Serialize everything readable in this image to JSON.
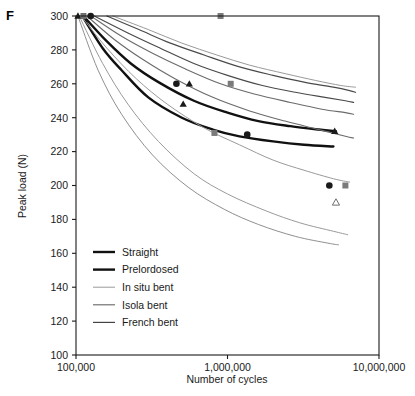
{
  "panel": {
    "label": "F"
  },
  "chart_data": {
    "type": "line",
    "title": "",
    "xlabel": "Number of cycles",
    "ylabel": "Peak load (N)",
    "xscale": "log",
    "xlim": [
      100000,
      10000000
    ],
    "ylim": [
      100,
      300
    ],
    "xticks": [
      100000,
      1000000,
      10000000
    ],
    "xtick_labels": [
      "100,000",
      "1,000,000",
      "10,000,000"
    ],
    "yticks": [
      100,
      120,
      140,
      160,
      180,
      200,
      220,
      240,
      260,
      280,
      300
    ],
    "ytick_labels": [
      "100",
      "120",
      "140",
      "160",
      "180",
      "200",
      "220",
      "240",
      "260",
      "280",
      "300"
    ],
    "grid": false,
    "legend_position": "lower-left",
    "legend": [
      {
        "name": "Straight",
        "color": "#111111",
        "width": 2.4
      },
      {
        "name": "Prelordosed",
        "color": "#111111",
        "width": 2.4
      },
      {
        "name": "In situ bent",
        "color": "#9a9a9a",
        "width": 1.0
      },
      {
        "name": "Isola bent",
        "color": "#666666",
        "width": 1.1
      },
      {
        "name": "French bent",
        "color": "#444444",
        "width": 1.2
      }
    ],
    "series": [
      {
        "name": "Straight",
        "color": "#111111",
        "width": 2.4,
        "points": [
          [
            110000,
            300
          ],
          [
            150000,
            281
          ],
          [
            200000,
            268
          ],
          [
            300000,
            252
          ],
          [
            500000,
            240
          ],
          [
            800000,
            233
          ],
          [
            1200000,
            229
          ],
          [
            2000000,
            226
          ],
          [
            3200000,
            224
          ],
          [
            5000000,
            223
          ]
        ]
      },
      {
        "name": "Prelordosed",
        "color": "#111111",
        "width": 2.4,
        "points": [
          [
            112000,
            300
          ],
          [
            160000,
            285
          ],
          [
            230000,
            272
          ],
          [
            350000,
            261
          ],
          [
            600000,
            250
          ],
          [
            1000000,
            243
          ],
          [
            1600000,
            238
          ],
          [
            2600000,
            235
          ],
          [
            4000000,
            233
          ],
          [
            5200000,
            232
          ]
        ]
      },
      {
        "name": "In situ bent A",
        "color": "#9a9a9a",
        "width": 1.0,
        "points": [
          [
            105000,
            300
          ],
          [
            150000,
            272
          ],
          [
            220000,
            248
          ],
          [
            350000,
            226
          ],
          [
            600000,
            207
          ],
          [
            1000000,
            195
          ],
          [
            1800000,
            185
          ],
          [
            3000000,
            178
          ],
          [
            5000000,
            173
          ],
          [
            6200000,
            171
          ]
        ]
      },
      {
        "name": "In situ bent B",
        "color": "#9a9a9a",
        "width": 1.0,
        "points": [
          [
            108000,
            300
          ],
          [
            160000,
            281
          ],
          [
            250000,
            263
          ],
          [
            400000,
            248
          ],
          [
            700000,
            234
          ],
          [
            1200000,
            224
          ],
          [
            2000000,
            215
          ],
          [
            3200000,
            209
          ],
          [
            5000000,
            204
          ],
          [
            6400000,
            202
          ]
        ]
      },
      {
        "name": "Isola bent A",
        "color": "#6b6b6b",
        "width": 1.1,
        "points": [
          [
            118000,
            300
          ],
          [
            180000,
            286
          ],
          [
            280000,
            274
          ],
          [
            450000,
            263
          ],
          [
            800000,
            252
          ],
          [
            1400000,
            244
          ],
          [
            2400000,
            238
          ],
          [
            4000000,
            233
          ],
          [
            6000000,
            229
          ],
          [
            6800000,
            228
          ]
        ]
      },
      {
        "name": "Isola bent B",
        "color": "#6b6b6b",
        "width": 1.1,
        "points": [
          [
            125000,
            300
          ],
          [
            200000,
            288
          ],
          [
            320000,
            278
          ],
          [
            520000,
            269
          ],
          [
            900000,
            260
          ],
          [
            1500000,
            254
          ],
          [
            2600000,
            249
          ],
          [
            4200000,
            245
          ],
          [
            6000000,
            243
          ],
          [
            6800000,
            242
          ]
        ]
      },
      {
        "name": "French bent A",
        "color": "#4a4a4a",
        "width": 1.2,
        "points": [
          [
            132000,
            300
          ],
          [
            220000,
            290
          ],
          [
            360000,
            281
          ],
          [
            600000,
            272
          ],
          [
            1000000,
            265
          ],
          [
            1700000,
            259
          ],
          [
            2800000,
            255
          ],
          [
            4400000,
            252
          ],
          [
            6000000,
            250
          ],
          [
            6800000,
            249
          ]
        ]
      },
      {
        "name": "French bent B",
        "color": "#4a4a4a",
        "width": 1.2,
        "points": [
          [
            160000,
            300
          ],
          [
            260000,
            292
          ],
          [
            420000,
            284
          ],
          [
            700000,
            277
          ],
          [
            1200000,
            270
          ],
          [
            2000000,
            265
          ],
          [
            3200000,
            261
          ],
          [
            5000000,
            258
          ],
          [
            6400000,
            256
          ],
          [
            7000000,
            255
          ]
        ]
      },
      {
        "name": "Lower gray A",
        "color": "#8f8f8f",
        "width": 1.0,
        "points": [
          [
            103000,
            300
          ],
          [
            140000,
            268
          ],
          [
            200000,
            242
          ],
          [
            320000,
            218
          ],
          [
            550000,
            199
          ],
          [
            950000,
            186
          ],
          [
            1600000,
            177
          ],
          [
            2800000,
            170
          ],
          [
            4600000,
            166
          ],
          [
            5400000,
            165
          ]
        ]
      },
      {
        "name": "Upper thin gray",
        "color": "#9a9a9a",
        "width": 1.0,
        "points": [
          [
            175000,
            300
          ],
          [
            300000,
            292
          ],
          [
            500000,
            284
          ],
          [
            850000,
            277
          ],
          [
            1400000,
            271
          ],
          [
            2400000,
            266
          ],
          [
            3800000,
            262
          ],
          [
            5600000,
            259
          ],
          [
            7000000,
            258
          ]
        ]
      }
    ],
    "markers": [
      {
        "shape": "triangle",
        "fill": "filled",
        "color": "#1a1a1a",
        "x": 103000,
        "y": 300
      },
      {
        "shape": "square",
        "fill": "filled",
        "color": "#6e6e6e",
        "x": 112000,
        "y": 300
      },
      {
        "shape": "circle",
        "fill": "filled",
        "color": "#1a1a1a",
        "x": 125000,
        "y": 300
      },
      {
        "shape": "square",
        "fill": "filled",
        "color": "#7a7a7a",
        "x": 900000,
        "y": 300
      },
      {
        "shape": "circle",
        "fill": "filled",
        "color": "#1a1a1a",
        "x": 460000,
        "y": 260
      },
      {
        "shape": "triangle",
        "fill": "filled",
        "color": "#1a1a1a",
        "x": 560000,
        "y": 260
      },
      {
        "shape": "square",
        "fill": "filled",
        "color": "#7a7a7a",
        "x": 1050000,
        "y": 260
      },
      {
        "shape": "triangle",
        "fill": "filled",
        "color": "#1a1a1a",
        "x": 510000,
        "y": 248
      },
      {
        "shape": "square",
        "fill": "filled",
        "color": "#7a7a7a",
        "x": 820000,
        "y": 231
      },
      {
        "shape": "circle",
        "fill": "filled",
        "color": "#1a1a1a",
        "x": 1350000,
        "y": 230
      },
      {
        "shape": "triangle",
        "fill": "filled",
        "color": "#1a1a1a",
        "x": 5100000,
        "y": 232
      },
      {
        "shape": "circle",
        "fill": "filled",
        "color": "#1a1a1a",
        "x": 4700000,
        "y": 200
      },
      {
        "shape": "square",
        "fill": "filled",
        "color": "#7a7a7a",
        "x": 6000000,
        "y": 200
      },
      {
        "shape": "triangle",
        "fill": "open",
        "color": "#6e6e6e",
        "x": 5200000,
        "y": 190
      }
    ]
  }
}
